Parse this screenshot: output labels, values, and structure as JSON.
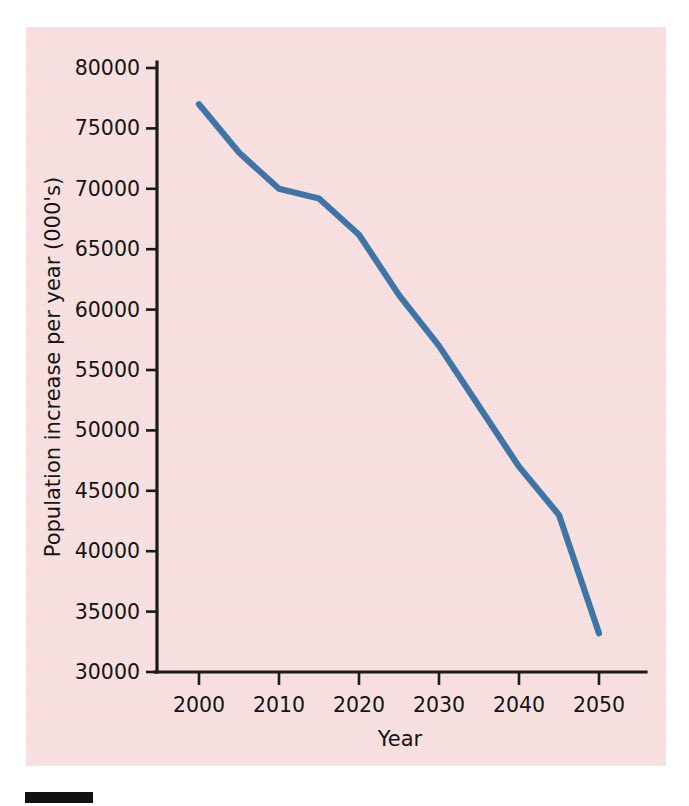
{
  "figure": {
    "background_color": "#f8dfdf",
    "page_color": "#ffffff",
    "footer_bar_color": "#111111",
    "footer_bar_name": "figure-marker-bar"
  },
  "chart_data": {
    "type": "line",
    "title": "",
    "subtitle": "",
    "xlabel": "Year",
    "ylabel": "Population increase per year (000's)",
    "xlim": [
      1995,
      2055
    ],
    "ylim": [
      30000,
      80000
    ],
    "grid": false,
    "legend": false,
    "legend_position": "none",
    "line_color": "#3f74a6",
    "axis_color": "#1a1a1a",
    "x_ticks": [
      2000,
      2010,
      2020,
      2030,
      2040,
      2050
    ],
    "x_tick_labels": [
      "2000",
      "2010",
      "2020",
      "2030",
      "2040",
      "2050"
    ],
    "y_ticks": [
      30000,
      35000,
      40000,
      45000,
      50000,
      55000,
      60000,
      65000,
      70000,
      75000,
      80000
    ],
    "y_tick_labels": [
      "30000",
      "35000",
      "40000",
      "45000",
      "50000",
      "55000",
      "60000",
      "65000",
      "70000",
      "75000",
      "80000"
    ],
    "series": [
      {
        "name": "Population increase per year",
        "x": [
          2000,
          2005,
          2010,
          2015,
          2020,
          2025,
          2030,
          2035,
          2040,
          2045,
          2050
        ],
        "values": [
          77000,
          73000,
          70000,
          69200,
          66200,
          61200,
          57000,
          52000,
          47000,
          43000,
          33200
        ]
      }
    ]
  },
  "axes": {
    "x_axis_name": "x-axis",
    "y_axis_name": "y-axis"
  }
}
